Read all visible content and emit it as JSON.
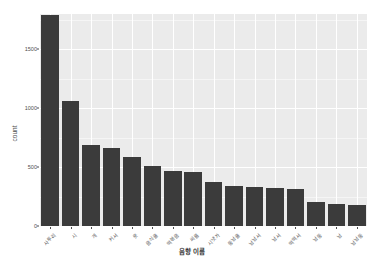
{
  "chart_data": {
    "type": "bar",
    "title": "",
    "xlabel": "음향 이름",
    "ylabel": "count",
    "categories": [
      "사투리",
      "시",
      "개",
      "커서",
      "옷",
      "음식을",
      "떡볶음",
      "씨름",
      "시냇가",
      "동남을",
      "남남서",
      "남서",
      "떡떡서",
      "남동",
      "남",
      "남남동"
    ],
    "values": [
      1790,
      1060,
      690,
      660,
      590,
      510,
      465,
      455,
      370,
      340,
      330,
      320,
      315,
      205,
      190,
      175
    ],
    "ylim": [
      0,
      1800
    ],
    "yticks": [
      0,
      500,
      1000,
      1500
    ],
    "ytick_labels": [
      "0",
      "500",
      "1000",
      "1500"
    ],
    "grid": true,
    "legend": "none",
    "bar_color": "#3b3b3b",
    "panel_color": "#ebebeb",
    "grid_color": "#ffffff",
    "background": "#ffffff"
  }
}
